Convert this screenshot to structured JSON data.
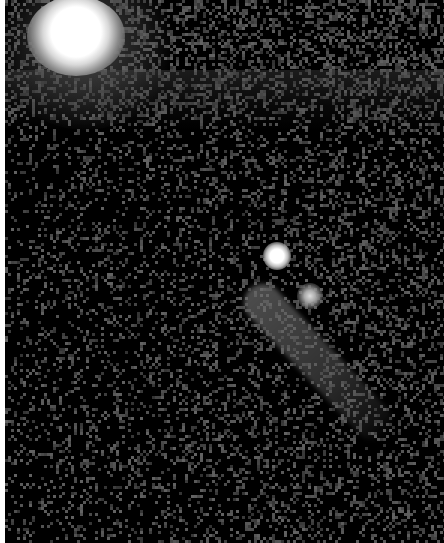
{
  "image": {
    "description": "Grayscale astronomical image of a comet with a bright nucleus, a secondary fragment and a diffuse tail extending to the lower right; a bright overexposed star in the upper-left corner on a noisy black sky background.",
    "colors": {
      "background": "#000000",
      "border": "#ffffff",
      "bright_object": "#ffffff",
      "tail": "#6e6e6e"
    },
    "objects": [
      {
        "name": "bright-star",
        "approx_center": [
          70,
          30
        ]
      },
      {
        "name": "comet-nucleus",
        "approx_center": [
          272,
          256
        ]
      },
      {
        "name": "comet-fragment",
        "approx_center": [
          305,
          296
        ]
      },
      {
        "name": "comet-tail",
        "approx_extent": [
          [
            260,
            260
          ],
          [
            410,
            410
          ]
        ]
      }
    ]
  }
}
